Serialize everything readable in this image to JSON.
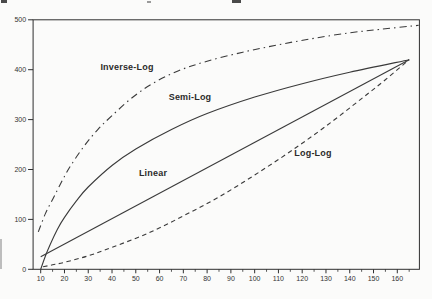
{
  "figure": {
    "description_labels": [
      "Inverse-Log",
      "Semi-Log",
      "Linear",
      "Log-Log"
    ]
  },
  "chart_data": {
    "type": "line",
    "title": "",
    "xlabel": "",
    "ylabel": "",
    "xlim": [
      6.8,
      169.3
    ],
    "ylim": [
      0,
      500
    ],
    "grid": false,
    "legend_position": "inline-labels",
    "x_ticks_major": [
      10,
      20,
      30,
      40,
      50,
      60,
      70,
      80,
      90,
      100,
      110,
      120,
      130,
      140,
      150,
      160
    ],
    "x_ticks_minor": [
      15,
      25,
      35,
      45,
      55,
      65,
      75,
      85,
      95,
      105,
      115,
      125,
      135,
      145,
      155,
      165
    ],
    "y_ticks": [
      0,
      100,
      200,
      300,
      400,
      500
    ],
    "series": [
      {
        "name": "Inverse-Log",
        "style": "dash-dot",
        "points": [
          [
            9,
            75
          ],
          [
            12,
            112
          ],
          [
            15,
            140
          ],
          [
            18,
            168
          ],
          [
            22,
            203
          ],
          [
            28,
            245
          ],
          [
            34,
            280
          ],
          [
            40,
            308
          ],
          [
            48,
            342
          ],
          [
            57,
            372
          ],
          [
            68,
            398
          ],
          [
            80,
            417
          ],
          [
            95,
            435
          ],
          [
            110,
            450
          ],
          [
            125,
            463
          ],
          [
            140,
            474
          ],
          [
            153,
            481
          ],
          [
            169,
            489
          ]
        ]
      },
      {
        "name": "Semi-Log",
        "style": "solid",
        "points": [
          [
            10,
            0
          ],
          [
            12,
            27
          ],
          [
            14,
            50
          ],
          [
            17,
            80
          ],
          [
            20,
            104
          ],
          [
            25,
            137
          ],
          [
            30,
            165
          ],
          [
            40,
            208
          ],
          [
            50,
            241
          ],
          [
            65,
            280
          ],
          [
            80,
            312
          ],
          [
            100,
            345
          ],
          [
            120,
            372
          ],
          [
            140,
            395
          ],
          [
            165,
            420
          ]
        ]
      },
      {
        "name": "Linear",
        "style": "solid",
        "points": [
          [
            10,
            25
          ],
          [
            165,
            420
          ]
        ]
      },
      {
        "name": "Log-Log",
        "style": "dashed",
        "points": [
          [
            11,
            5
          ],
          [
            15,
            9
          ],
          [
            20,
            14
          ],
          [
            30,
            27
          ],
          [
            40,
            44
          ],
          [
            55,
            72
          ],
          [
            70,
            107
          ],
          [
            85,
            145
          ],
          [
            100,
            189
          ],
          [
            115,
            236
          ],
          [
            130,
            287
          ],
          [
            145,
            342
          ],
          [
            155,
            380
          ],
          [
            165,
            420
          ]
        ]
      }
    ]
  }
}
